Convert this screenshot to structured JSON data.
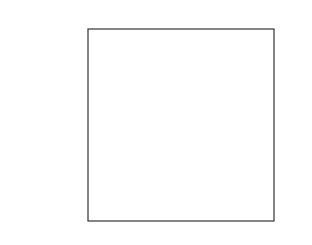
{
  "problem_number": "4.",
  "chart_data": {
    "type": "line",
    "title": "",
    "xlabel": "",
    "ylabel": "",
    "xlim": [
      -10,
      10
    ],
    "ylim": [
      -10,
      10
    ],
    "grid": false,
    "function_description": "cube-root-shaped curve through labeled points, arrows at both ends",
    "points": [
      {
        "x": 1,
        "y": -8,
        "label": "(1, -8)"
      },
      {
        "x": 2,
        "y": -1,
        "label": "(2, -1)"
      },
      {
        "x": 4,
        "y": 1,
        "label": "(4, 1)"
      },
      {
        "x": 5,
        "y": 8,
        "label": "(5, 8)"
      }
    ],
    "inflection_point": {
      "x": 3,
      "y": 0
    }
  }
}
